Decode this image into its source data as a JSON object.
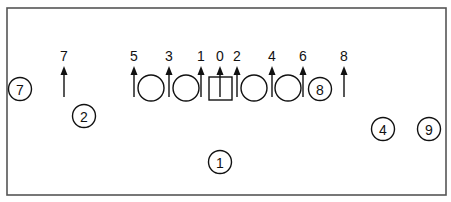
{
  "diagram": {
    "frame": {
      "x": 7,
      "y": 8,
      "width": 439,
      "height": 187
    },
    "arrows": [
      {
        "label": "7",
        "x": 64
      },
      {
        "label": "5",
        "x": 134
      },
      {
        "label": "3",
        "x": 169
      },
      {
        "label": "1",
        "x": 201
      },
      {
        "label": "0",
        "x": 220
      },
      {
        "label": "2",
        "x": 237
      },
      {
        "label": "4",
        "x": 272
      },
      {
        "label": "6",
        "x": 303
      },
      {
        "label": "8",
        "x": 344
      }
    ],
    "open_circles": [
      {
        "cx": 151,
        "cy": 88
      },
      {
        "cx": 186,
        "cy": 88
      },
      {
        "cx": 254,
        "cy": 88
      },
      {
        "cx": 288,
        "cy": 88
      }
    ],
    "square": {
      "x": 209,
      "y": 77,
      "width": 23,
      "height": 23
    },
    "callouts": [
      {
        "label": "7",
        "cx": 20,
        "cy": 89
      },
      {
        "label": "2",
        "cx": 84,
        "cy": 116
      },
      {
        "label": "8",
        "cx": 320,
        "cy": 89
      },
      {
        "label": "1",
        "cx": 220,
        "cy": 162
      },
      {
        "label": "4",
        "cx": 383,
        "cy": 129
      },
      {
        "label": "9",
        "cx": 429,
        "cy": 129
      }
    ]
  }
}
